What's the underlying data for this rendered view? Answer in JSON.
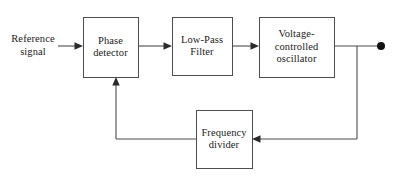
{
  "diagram": {
    "background_color": "#ffffff",
    "line_color": "#4d4d4d",
    "text_color": "#1a1a1a",
    "blocks": [
      {
        "id": "phase-detector",
        "label_line1": "Phase",
        "label_line2": "detector",
        "x": 83,
        "y": 17,
        "w": 55,
        "h": 60
      },
      {
        "id": "low-pass-filter",
        "label_line1": "Low-Pass",
        "label_line2": "Filter",
        "x": 172,
        "y": 17,
        "w": 60,
        "h": 58
      },
      {
        "id": "voltage-controlled-oscillator",
        "label_line1": "Voltage-",
        "label_line2": "controlled",
        "label_line3": "oscillator",
        "x": 259,
        "y": 17,
        "w": 75,
        "h": 60
      },
      {
        "id": "frequency-divider",
        "label_line1": "Frequency",
        "label_line2": "divider",
        "x": 196,
        "y": 110,
        "w": 56,
        "h": 58
      }
    ],
    "external_labels": [
      {
        "id": "reference-signal",
        "line1": "Reference",
        "line2": "signal"
      }
    ],
    "terminals": [
      {
        "id": "output-terminal",
        "x": 381,
        "y": 46,
        "r": 4
      }
    ],
    "connections": [
      {
        "id": "reference-to-phase-detector",
        "from": "reference-signal",
        "to": "phase-detector"
      },
      {
        "id": "phase-detector-to-low-pass-filter",
        "from": "phase-detector",
        "to": "low-pass-filter"
      },
      {
        "id": "low-pass-filter-to-vco",
        "from": "low-pass-filter",
        "to": "voltage-controlled-oscillator"
      },
      {
        "id": "vco-to-output",
        "from": "voltage-controlled-oscillator",
        "to": "output-terminal"
      },
      {
        "id": "output-to-frequency-divider",
        "from": "output-terminal",
        "to": "frequency-divider"
      },
      {
        "id": "frequency-divider-to-phase-detector",
        "from": "frequency-divider",
        "to": "phase-detector"
      }
    ]
  }
}
